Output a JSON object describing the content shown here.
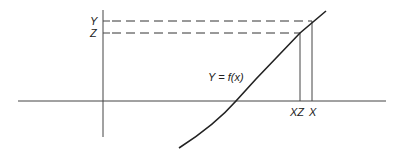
{
  "diagram": {
    "labels": {
      "y_level": "Y",
      "z_level": "Z",
      "function": "Y = f(x)",
      "xz_point": "XZ",
      "x_point": "X"
    },
    "colors": {
      "line": "#222222",
      "axis": "#444444",
      "background": "#ffffff"
    }
  }
}
